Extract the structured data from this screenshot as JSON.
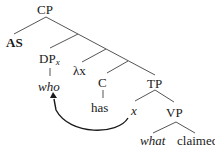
{
  "diagram": {
    "type": "syntax-tree",
    "nodes": {
      "root": "CP",
      "as": "AS",
      "dp": "DP",
      "dp_sub": "x",
      "who": "who",
      "lambda": "λx",
      "c": "C",
      "has": "has",
      "tp": "TP",
      "x": "x",
      "vp": "VP",
      "what": "what",
      "claimed": "claimed"
    },
    "arrow": {
      "from": "x",
      "to": "who",
      "label": "movement"
    },
    "colors": {
      "line": "#555555",
      "arrow": "#1a1a1a",
      "text": "#1a1a1a"
    }
  }
}
